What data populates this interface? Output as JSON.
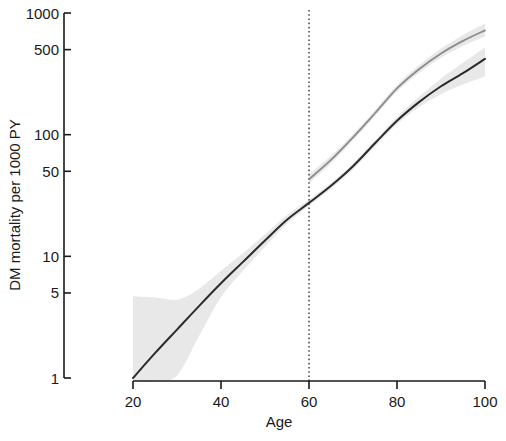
{
  "chart_data": {
    "type": "line",
    "title": "",
    "xlabel": "Age",
    "ylabel": "DM mortality per 1000 PY",
    "xlim": [
      12,
      100
    ],
    "ylim": [
      0.8,
      1100
    ],
    "yscale": "log",
    "xscale": "linear",
    "grid": false,
    "legend": "none",
    "xticks": [
      20,
      40,
      60,
      80,
      100
    ],
    "xtick_labels": [
      "20",
      "40",
      "60",
      "80",
      "100"
    ],
    "yticks": [
      1,
      5,
      10,
      50,
      100,
      500,
      1000
    ],
    "ytick_labels": [
      "1",
      "5",
      "10",
      "50",
      "100",
      "500",
      "1000"
    ],
    "annotations": [
      {
        "type": "vline",
        "x": 60,
        "style": "dotted",
        "color": "#000000",
        "label": "age 60 reference line"
      }
    ],
    "series": [
      {
        "name": "Lower curve (dark)",
        "color": "#2b2b2b",
        "width": 2.0,
        "x": [
          20,
          25,
          30,
          35,
          40,
          45,
          50,
          55,
          60,
          65,
          70,
          75,
          80,
          85,
          90,
          95,
          100
        ],
        "y": [
          1.0,
          1.6,
          2.5,
          3.9,
          6.0,
          9.0,
          13.5,
          20.0,
          27.5,
          38.0,
          55.0,
          85.0,
          130.0,
          185.0,
          250.0,
          320.0,
          420.0
        ],
        "band": {
          "color": "#e8e8e8",
          "lower": [
            0.8,
            0.85,
            1.05,
            2.2,
            4.6,
            7.6,
            12.0,
            18.5,
            26.0,
            36.0,
            52.0,
            80.0,
            122.0,
            168.0,
            215.0,
            258.0,
            300.0
          ],
          "upper": [
            4.7,
            4.6,
            4.4,
            5.4,
            7.6,
            10.6,
            15.2,
            21.8,
            29.2,
            40.0,
            58.0,
            90.0,
            140.0,
            205.0,
            290.0,
            390.0,
            520.0
          ]
        }
      },
      {
        "name": "Upper curve (light gray)",
        "color": "#8c8c8c",
        "width": 1.8,
        "x": [
          60,
          65,
          70,
          75,
          80,
          85,
          90,
          95,
          100
        ],
        "y": [
          43.0,
          62.0,
          95.0,
          150.0,
          240.0,
          345.0,
          465.0,
          590.0,
          720.0
        ],
        "band": {
          "color": "#e8e8e8",
          "lower": [
            40.0,
            58.0,
            90.0,
            142.0,
            226.0,
            322.0,
            428.0,
            535.0,
            640.0
          ],
          "upper": [
            47.0,
            67.0,
            101.0,
            159.0,
            256.0,
            372.0,
            510.0,
            660.0,
            820.0
          ]
        }
      }
    ]
  },
  "axes": {
    "x_label": "Age",
    "y_label": "DM mortality per 1000 PY",
    "x_tick_labels": [
      "20",
      "40",
      "60",
      "80",
      "100"
    ],
    "y_tick_labels": [
      "1000",
      "500",
      "100",
      "50",
      "10",
      "5",
      "1"
    ]
  },
  "colors": {
    "dark_line": "#2b2b2b",
    "gray_line": "#8c8c8c",
    "band": "#e8e8e8",
    "axis": "#1a1a1a",
    "background": "#ffffff"
  }
}
